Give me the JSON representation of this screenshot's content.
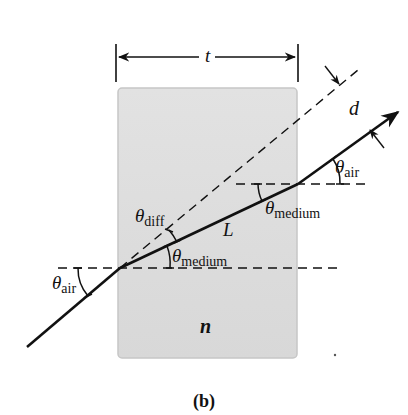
{
  "figure": {
    "caption": "(b)",
    "labels": {
      "thickness": "t",
      "offset": "d",
      "path_length": "L",
      "index": "n",
      "theta_symbol": "θ",
      "theta_air_sub": "air",
      "theta_medium_sub": "medium",
      "theta_diff_sub": "diff"
    },
    "colors": {
      "block_fill": "#dcdcdc",
      "block_edge": "#c4c4c4",
      "line": "#111111"
    }
  }
}
